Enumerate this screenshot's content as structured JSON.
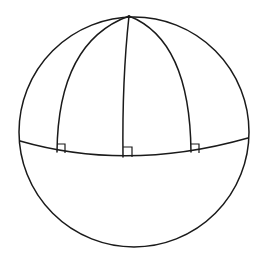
{
  "diagram": {
    "type": "sphere-with-meridians",
    "colors": {
      "stroke": "#1a1a1a",
      "background": "#ffffff"
    },
    "sphere": {
      "cx": 134,
      "cy": 132,
      "r": 115
    },
    "pole": {
      "x": 129,
      "y": 16
    },
    "meridians": [
      {
        "name": "left",
        "foot_x": 57
      },
      {
        "name": "center",
        "foot_x": 123
      },
      {
        "name": "right",
        "foot_x": 191
      }
    ],
    "right_angle_marks": 3,
    "labels": []
  }
}
